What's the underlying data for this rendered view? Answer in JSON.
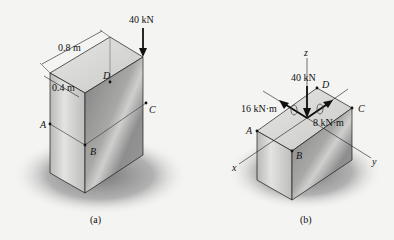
{
  "figure_a": {
    "caption": "(a)",
    "load_label": "40 kN",
    "dim_length": "0.8 m",
    "dim_width": "0.4 m",
    "points": {
      "A": "A",
      "B": "B",
      "C": "C",
      "D": "D"
    }
  },
  "figure_b": {
    "caption": "(b)",
    "load_label": "40 kN",
    "moment_x_label": "16 kN·m",
    "moment_y_label": "8 kN·m",
    "axes": {
      "x": "x",
      "y": "y",
      "z": "z"
    },
    "points": {
      "A": "A",
      "B": "B",
      "C": "C",
      "D": "D"
    }
  },
  "colors": {
    "background": "#f4f4f3",
    "shadow": "#8a8a8a",
    "edge": "#1a1a1a",
    "top_face": "#d9d9d8",
    "left_face": "#c4c4c3",
    "right_face": "#8f8f8f"
  }
}
